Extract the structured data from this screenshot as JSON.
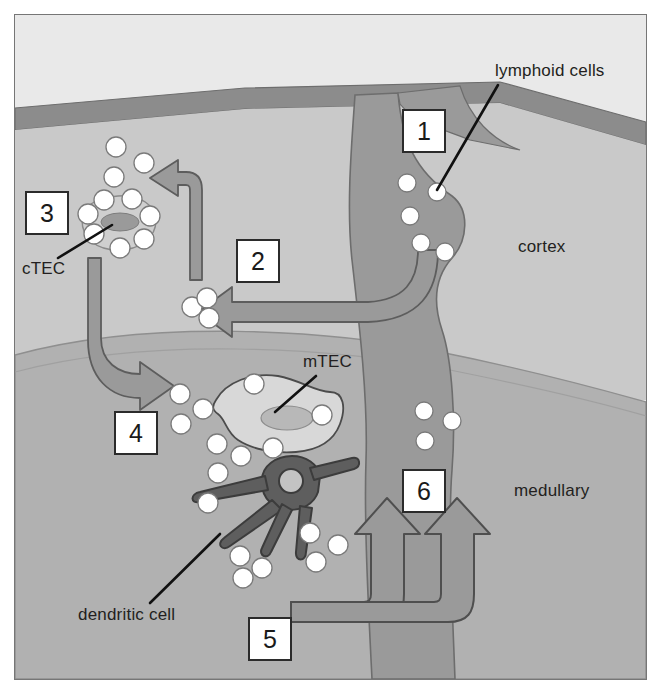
{
  "figure": {
    "colors": {
      "frame_border": "#6f6f6f",
      "outside_bg": "#e2e2e2",
      "capsule": "#8c8c8c",
      "cortex": "#c9c9c9",
      "medulla": "#b0b0b0",
      "vessel": "#9a9a9a",
      "vessel_outline": "#6d6d6d",
      "arrow_fill": "#9a9a9a",
      "arrow_outline": "#5d5d5d",
      "lymphoid_cell": "#ffffff",
      "lymphoid_cell_outline": "#7a7a7a",
      "ctec_body": "#cfcfcf",
      "ctec_nucleus": "#9a9a9a",
      "mtec_body": "#d8d8d8",
      "mtec_nucleus": "#b4b4b4",
      "dendritic_cell": "#5e5e5e",
      "dendritic_outline": "#3c3c3c",
      "label_box_fill": "#ffffff",
      "label_box_border": "#2b2b2b",
      "text": "#231f20"
    }
  },
  "region_labels": [
    {
      "id": "cortex",
      "text": "cortex",
      "x": 518,
      "y": 252
    },
    {
      "id": "medullary",
      "text": "medullary",
      "x": 514,
      "y": 496
    }
  ],
  "callouts": [
    {
      "id": "lymphoid-cells",
      "text": "lymphoid cells",
      "text_x": 495,
      "text_y": 76,
      "line": "M 498,85 L 437,190"
    },
    {
      "id": "ctec",
      "text": "cTEC",
      "text_x": 22,
      "text_y": 274,
      "line": "M 58,258 L 112,225"
    },
    {
      "id": "mtec",
      "text": "mTEC",
      "text_x": 303,
      "text_y": 367,
      "line": "M 316,376 L 275,412"
    },
    {
      "id": "dendritic-cell",
      "text": "dendritic cell",
      "text_x": 78,
      "text_y": 620,
      "line": "M 150,603 L 220,534"
    }
  ],
  "step_boxes": [
    {
      "id": "step-1",
      "number": "1",
      "x": 403,
      "y": 110,
      "w": 42,
      "h": 42
    },
    {
      "id": "step-2",
      "number": "2",
      "x": 237,
      "y": 240,
      "w": 42,
      "h": 42
    },
    {
      "id": "step-3",
      "number": "3",
      "x": 26,
      "y": 192,
      "w": 42,
      "h": 42
    },
    {
      "id": "step-4",
      "number": "4",
      "x": 115,
      "y": 412,
      "w": 42,
      "h": 42
    },
    {
      "id": "step-5",
      "number": "5",
      "x": 249,
      "y": 618,
      "w": 42,
      "h": 42
    },
    {
      "id": "step-6",
      "number": "6",
      "x": 403,
      "y": 470,
      "w": 42,
      "h": 42
    }
  ],
  "lymphoid_cells_in_vessel": [
    {
      "cx": 407,
      "cy": 183,
      "r": 9
    },
    {
      "cx": 437,
      "cy": 192,
      "r": 9
    },
    {
      "cx": 410,
      "cy": 216,
      "r": 9
    },
    {
      "cx": 421,
      "cy": 243,
      "r": 9
    },
    {
      "cx": 445,
      "cy": 252,
      "r": 9
    },
    {
      "cx": 424,
      "cy": 411,
      "r": 9
    },
    {
      "cx": 452,
      "cy": 421,
      "r": 9
    },
    {
      "cx": 425,
      "cy": 441,
      "r": 9
    }
  ],
  "lymphoid_cells_cortex_free": [
    {
      "cx": 116,
      "cy": 147,
      "r": 10
    },
    {
      "cx": 144,
      "cy": 163,
      "r": 10
    },
    {
      "cx": 114,
      "cy": 177,
      "r": 10
    },
    {
      "cx": 192,
      "cy": 307,
      "r": 10
    },
    {
      "cx": 207,
      "cy": 298,
      "r": 10
    },
    {
      "cx": 209,
      "cy": 318,
      "r": 10
    }
  ],
  "lymphoid_cells_rosette": [
    {
      "cx": 104,
      "cy": 200,
      "r": 10
    },
    {
      "cx": 132,
      "cy": 199,
      "r": 10
    },
    {
      "cx": 150,
      "cy": 216,
      "r": 10
    },
    {
      "cx": 144,
      "cy": 239,
      "r": 10
    },
    {
      "cx": 120,
      "cy": 248,
      "r": 10
    },
    {
      "cx": 94,
      "cy": 234,
      "r": 10
    },
    {
      "cx": 88,
      "cy": 214,
      "r": 10
    }
  ],
  "lymphoid_cells_medulla": [
    {
      "cx": 180,
      "cy": 394,
      "r": 10
    },
    {
      "cx": 203,
      "cy": 409,
      "r": 10
    },
    {
      "cx": 181,
      "cy": 424,
      "r": 10
    },
    {
      "cx": 254,
      "cy": 384,
      "r": 10
    },
    {
      "cx": 322,
      "cy": 415,
      "r": 10
    },
    {
      "cx": 217,
      "cy": 444,
      "r": 10
    },
    {
      "cx": 241,
      "cy": 456,
      "r": 10
    },
    {
      "cx": 273,
      "cy": 448,
      "r": 10
    },
    {
      "cx": 218,
      "cy": 473,
      "r": 10
    },
    {
      "cx": 208,
      "cy": 503,
      "r": 10
    },
    {
      "cx": 310,
      "cy": 533,
      "r": 10
    },
    {
      "cx": 338,
      "cy": 545,
      "r": 10
    },
    {
      "cx": 316,
      "cy": 562,
      "r": 10
    },
    {
      "cx": 240,
      "cy": 556,
      "r": 10
    },
    {
      "cx": 262,
      "cy": 568,
      "r": 10
    },
    {
      "cx": 243,
      "cy": 578,
      "r": 10
    }
  ],
  "arrows": [
    {
      "id": "arrow-step-2-into-cortex",
      "desc": "thick arrow from vessel to cortex pointing left"
    },
    {
      "id": "arrow-step-3-up",
      "desc": "arrow curving up-left toward cTEC region"
    },
    {
      "id": "arrow-step-4-into-medulla",
      "desc": "arrow curving down-right into medulla"
    },
    {
      "id": "arrow-step-5-left",
      "desc": "outlined arrow from step 5 turning upward"
    },
    {
      "id": "arrow-step-6-right",
      "desc": "outlined arrow turning upward into vessel"
    }
  ]
}
